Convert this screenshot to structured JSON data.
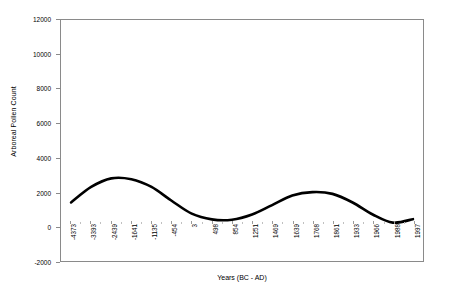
{
  "chart_data": {
    "type": "line",
    "title": "",
    "xlabel": "Years (BC - AD)",
    "ylabel": "Arboreal Pollen Count",
    "ylim": [
      -2000,
      12000
    ],
    "yticks": [
      12000,
      10000,
      8000,
      6000,
      4000,
      2000,
      0,
      -2000
    ],
    "ytick_labels": [
      "12000",
      "10000",
      "8000",
      "6000",
      "4000",
      "2000",
      "0",
      "-2000"
    ],
    "grid": false,
    "legend": "none",
    "categories": [
      "-4373",
      "-3393",
      "-2439",
      "-1641",
      "-1135",
      "-454",
      "3",
      "498",
      "854",
      "1251",
      "1469",
      "1639",
      "1768",
      "1861",
      "1933",
      "1966",
      "1988",
      "1997"
    ],
    "series": [
      {
        "name": "Arboreal Pollen Count",
        "color": "#000000",
        "values": [
          1400,
          2300,
          2800,
          2750,
          2300,
          1500,
          750,
          420,
          400,
          700,
          1250,
          1800,
          2000,
          1900,
          1400,
          700,
          230,
          430
        ]
      }
    ]
  },
  "axes": {
    "x_axis_title": "Years (BC - AD)",
    "y_axis_title": "Arboreal Pollen Count"
  },
  "style": {
    "line_color": "#000000",
    "frame_color": "#8a8a8a",
    "background": "#ffffff"
  }
}
